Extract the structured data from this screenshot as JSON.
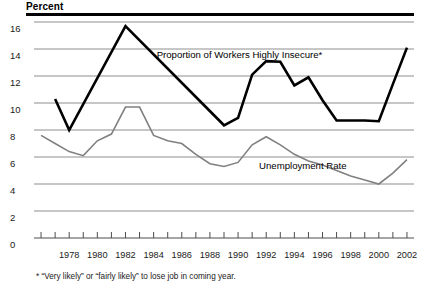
{
  "chart_data": {
    "type": "line",
    "title": "",
    "ylabel": "Percent",
    "xlabel": "",
    "ylim": [
      0,
      16
    ],
    "xlim": [
      1975.5,
      2002.5
    ],
    "grid": true,
    "legend_position": "inline-annotations",
    "y_ticks": [
      16,
      14,
      12,
      10,
      8,
      6,
      4,
      2,
      0
    ],
    "x_ticks": [
      1976,
      1977,
      1978,
      1979,
      1980,
      1981,
      1982,
      1983,
      1984,
      1985,
      1986,
      1987,
      1988,
      1989,
      1990,
      1991,
      1992,
      1993,
      1994,
      1995,
      1996,
      1997,
      1998,
      1999,
      2000,
      2001,
      2002
    ],
    "x_tick_labels": [
      "",
      "",
      "1978",
      "",
      "1980",
      "",
      "1982",
      "",
      "1984",
      "",
      "1986",
      "",
      "1988",
      "",
      "1990",
      "",
      "1992",
      "",
      "1994",
      "",
      "1996",
      "",
      "1998",
      "",
      "2000",
      "",
      "2002"
    ],
    "annotations": [
      {
        "text": "Proportion of Workers Highly Insecure*",
        "x": 1990.1,
        "y": 13.55
      },
      {
        "text": "Unemployment Rate",
        "x": 1994.6,
        "y": 5.35
      }
    ],
    "footnote": "* “Very likely” or “fairly likely” to lose job in coming year.",
    "series": [
      {
        "name": "Proportion of Workers Highly Insecure*",
        "style": "bold-black",
        "color": "#000000",
        "width": 2.6,
        "x": [
          1977,
          1978,
          1982,
          1989,
          1990,
          1991,
          1992,
          1993,
          1994,
          1995,
          1996,
          1997,
          1998,
          1999,
          2000,
          2001,
          2002
        ],
        "values": [
          10.3,
          8.0,
          15.7,
          8.35,
          8.9,
          12.1,
          13.1,
          13.05,
          11.3,
          11.9,
          10.2,
          8.7,
          8.7,
          8.7,
          8.65,
          11.4,
          14.1
        ]
      },
      {
        "name": "Unemployment Rate",
        "style": "thin-gray",
        "color": "#808080",
        "width": 1.6,
        "x": [
          1976,
          1977,
          1978,
          1979,
          1980,
          1981,
          1982,
          1983,
          1984,
          1985,
          1986,
          1987,
          1988,
          1989,
          1990,
          1991,
          1992,
          1993,
          1994,
          1995,
          1996,
          1997,
          1998,
          1999,
          2000,
          2001,
          2002
        ],
        "values": [
          7.6,
          7.0,
          6.4,
          6.1,
          7.2,
          7.7,
          9.7,
          9.7,
          7.6,
          7.2,
          7.0,
          6.2,
          5.5,
          5.3,
          5.6,
          6.9,
          7.5,
          6.9,
          6.2,
          5.7,
          5.4,
          5.0,
          4.6,
          4.3,
          4.0,
          4.8,
          5.8
        ]
      }
    ]
  },
  "axis": {
    "percent_label": "Percent"
  }
}
